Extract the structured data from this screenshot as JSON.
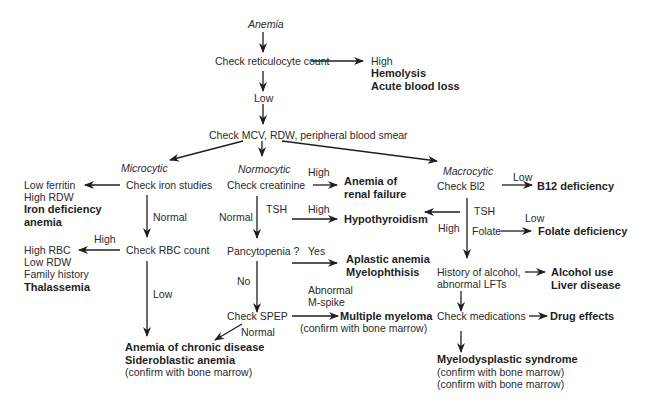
{
  "flowchart": {
    "root": "Anemia",
    "retic": {
      "label": "Check reticulocyte count",
      "high_label": "High",
      "high_results": [
        "Hemolysis",
        "Acute blood loss"
      ],
      "low_label": "Low"
    },
    "mcv": {
      "label": "Check MCV, RDW, peripheral blood smear"
    },
    "microcytic": {
      "category": "Microcytic",
      "iron_studies": "Check iron studies",
      "iron_result_plain": [
        "Low ferritin",
        "High RDW"
      ],
      "iron_result_bold": [
        "Iron deficiency",
        "anemia"
      ],
      "normal_label": "Normal",
      "rbc_count": "Check RBC count",
      "rbc_high_label": "High",
      "rbc_high_plain": [
        "High RBC",
        "Low RDW",
        "Family history"
      ],
      "rbc_high_bold": "Thalassemia",
      "rbc_low_label": "Low"
    },
    "normocytic": {
      "category": "Normocytic",
      "creatinine": "Check creatinine",
      "creatinine_high_label": "High",
      "renal_result": [
        "Anemia of",
        "renal failure"
      ],
      "normal_label": "Normal",
      "tsh_label": "TSH",
      "tsh_high_label": "High",
      "hypothyroid": "Hypothyroidism",
      "pancytopenia": "Pancytopenia ?",
      "yes_label": "Yes",
      "aplastic_result": [
        "Aplastic anemia",
        "Myelophthisis"
      ],
      "no_label": "No",
      "spep": "Check SPEP",
      "abnormal_label": [
        "Abnormal",
        "M-spike"
      ],
      "myeloma": "Multiple myeloma",
      "myeloma_note": "(confirm with bone marrow)",
      "spep_normal_label": "Normal",
      "chronic_results": [
        "Anemia of chronic disease",
        "Sideroblastic anemia"
      ],
      "chronic_note": "(confirm with bone marrow)"
    },
    "macrocytic": {
      "category": "Macrocytic",
      "b12": "Check Bl2",
      "b12_low_label": "Low",
      "b12_result": "B12 deficiency",
      "tsh_label": "TSH",
      "tsh_high_label": "High",
      "folate_label": "Folate",
      "folate_low_label": "Low",
      "folate_result": "Folate deficiency",
      "alcohol": [
        "History of alcohol,",
        "abnormal LFTs"
      ],
      "alcohol_results": [
        "Alcohol use",
        "Liver disease"
      ],
      "medications": "Check medications",
      "drug_result": "Drug effects",
      "mds": "Myelodysplastic syndrome",
      "mds_notes": [
        "(confirm with bone marrow)",
        "(confirm with bone marrow)"
      ]
    }
  }
}
